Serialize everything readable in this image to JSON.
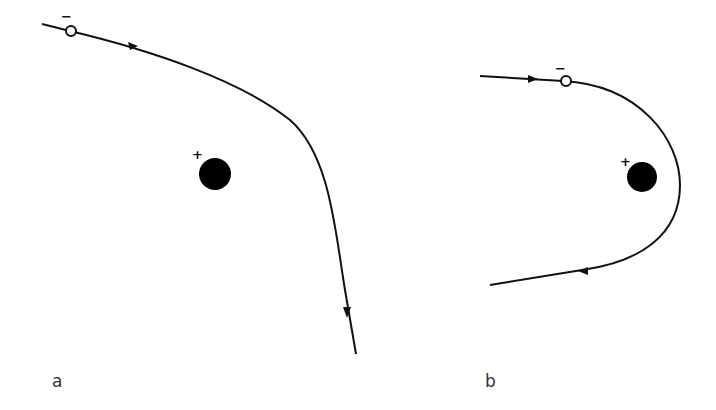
{
  "panels": [
    {
      "id": "a",
      "label": "a",
      "particle_sign": "−",
      "nucleus_sign": "+",
      "description": "Negative particle deflected past positive charge"
    },
    {
      "id": "b",
      "label": "b",
      "particle_sign": "−",
      "nucleus_sign": "+",
      "description": "Negative particle swinging around positive charge"
    }
  ],
  "colors": {
    "stroke": "#111111",
    "nucleus": "#000000",
    "particle_fill": "#ffffff",
    "background": "#ffffff"
  }
}
